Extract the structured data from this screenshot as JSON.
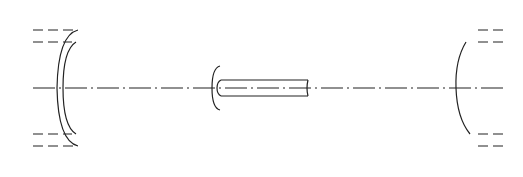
{
  "figure": {
    "labels": {
      "current_top": "i",
      "current_bottom": "i",
      "solenoid": "S",
      "coil": "C",
      "axis": "Axis"
    },
    "solenoid": {
      "turns_per_row": 31,
      "top_row_symbol": "dot (current out of page)",
      "bottom_row_symbol": "cross (current into page)"
    },
    "coil": {
      "turns_per_row": 7
    },
    "colors": {
      "line": "#222222",
      "background": "#ffffff"
    }
  }
}
